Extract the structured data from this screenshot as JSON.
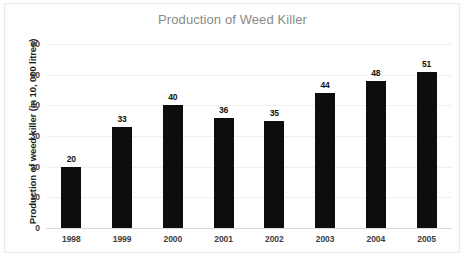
{
  "chart_data": {
    "type": "bar",
    "title": "Production of Weed Killer",
    "xlabel": "",
    "ylabel": "Production of weed killer (in 10, 000 litres)",
    "categories": [
      "1998",
      "1999",
      "2000",
      "2001",
      "2002",
      "2003",
      "2004",
      "2005"
    ],
    "values": [
      20,
      33,
      40,
      36,
      35,
      44,
      48,
      51
    ],
    "value_labels": [
      "20",
      "33",
      "40",
      "36",
      "35",
      "44",
      "48",
      "51"
    ],
    "ylim": [
      0,
      60
    ],
    "ytick_labels": [
      "0",
      "10",
      "20",
      "30",
      "40",
      "50",
      "60"
    ],
    "ytick_values": [
      0,
      10,
      20,
      30,
      40,
      50,
      60
    ],
    "grid": true,
    "grid_axis": "y",
    "legend": false,
    "bar_color": "#0d0d0d",
    "title_color": "#8a8a8a",
    "gridline_color": "#efefef",
    "axis_text_color": "#3a3a3a"
  }
}
